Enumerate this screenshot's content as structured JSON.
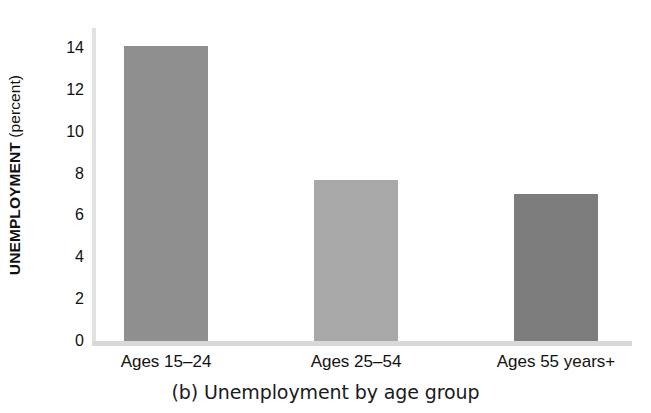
{
  "chart_data": {
    "type": "bar",
    "title": "(b) Unemployment by age group",
    "xlabel": "",
    "ylabel": "UNEMPLOYMENT (percent)",
    "ylabel_bold_part": "UNEMPLOYMENT",
    "ylabel_light_part": " (percent)",
    "categories": [
      "Ages 15–24",
      "Ages 25–54",
      "Ages 55 years+"
    ],
    "values": [
      14.1,
      7.7,
      7.0
    ],
    "ylim": [
      0,
      15
    ],
    "yticks": [
      0,
      2,
      4,
      6,
      8,
      10,
      12,
      14
    ],
    "ytick_labels": [
      "0",
      "2",
      "4",
      "6",
      "8",
      "10",
      "12",
      "14"
    ],
    "grid": false,
    "legend": false,
    "bar_colors": [
      "#8f8f8f",
      "#a8a8a8",
      "#7d7d7d"
    ],
    "axis_color": "#dcdcdc",
    "text_color": "#111111"
  },
  "caption": "(b) Unemployment by age group"
}
